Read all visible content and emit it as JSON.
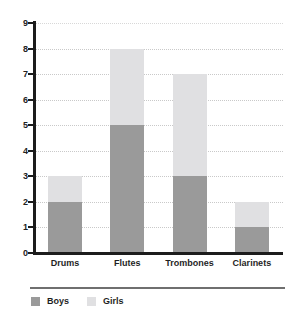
{
  "chart_data": {
    "type": "bar",
    "stacked": true,
    "title": "",
    "subtitle": "",
    "xlabel": "",
    "ylabel": "",
    "categories": [
      "Drums",
      "Flutes",
      "Trombones",
      "Clarinets"
    ],
    "series": [
      {
        "name": "Boys",
        "values": [
          2,
          5,
          3,
          1
        ],
        "color": "#9a9a9a"
      },
      {
        "name": "Girls",
        "values": [
          1,
          3,
          4,
          1
        ],
        "color": "#e0e0e2"
      }
    ],
    "totals": [
      3,
      8,
      7,
      2
    ],
    "ylim": [
      0,
      9
    ],
    "ytick_step": 1,
    "ytick_labels": [
      "0",
      "1",
      "2",
      "3",
      "4",
      "5",
      "6",
      "7",
      "8",
      "9"
    ],
    "grid": true,
    "grid_axis": "y",
    "grid_style": "dotted",
    "legend_position": "bottom-left",
    "background_color": "#ffffff",
    "axis_color": "#1c1c1c",
    "grid_color": "#c9c9c9"
  },
  "legend": {
    "items": [
      {
        "label": "Boys",
        "color": "#9a9a9a"
      },
      {
        "label": "Girls",
        "color": "#e0e0e2"
      }
    ]
  }
}
